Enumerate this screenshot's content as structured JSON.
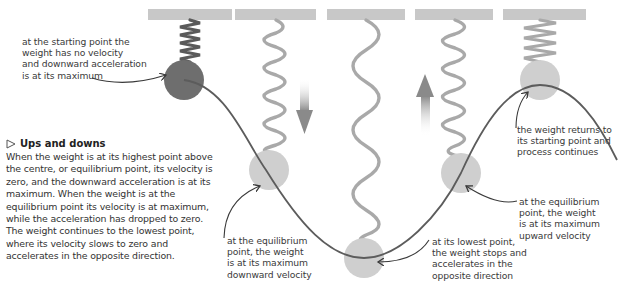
{
  "diagram": {
    "colors": {
      "ceiling": "#c8c8c8",
      "spring": "#a9a9a9",
      "spring_compressed_start": "#5a5a5a",
      "weight_start": "#6e6e6e",
      "weight": "#cfcfcf",
      "curve": "#5c5c5c",
      "arrow_gradient_end": "#8a8a8a"
    },
    "annotations": {
      "start": "at the starting point the\nweight has no velocity\nand downward acceleration\nis at its maximum",
      "equilibrium_down": "at the equilibrium\npoint, the weight\nis at its maximum\ndownward velocity",
      "lowest": "at its lowest point,\nthe weight stops and\naccelerates in the\nopposite direction",
      "equilibrium_up": "at the equilibrium\npoint, the weight\nis at its maximum\nupward velocity",
      "returns": "the weight returns to\nits starting point and\nprocess continues"
    },
    "stages": [
      {
        "id": "start",
        "position": "highest point"
      },
      {
        "id": "equilibrium-down",
        "position": "equilibrium, moving down"
      },
      {
        "id": "lowest",
        "position": "lowest point"
      },
      {
        "id": "equilibrium-up",
        "position": "equilibrium, moving up"
      },
      {
        "id": "return",
        "position": "highest point"
      }
    ]
  },
  "sidebar": {
    "title": "Ups and downs",
    "title_icon": "triangle-right-outline-icon",
    "body": "When the weight is at its highest point above the centre, or equilibrium point, its velocity is zero, and the downward acceleration is at its maximum. When the weight is at the equilibrium point its velocity is at maximum, while the acceleration has dropped to zero. The weight continues to the lowest point, where its velocity slows to zero and accelerates in the opposite direction."
  }
}
